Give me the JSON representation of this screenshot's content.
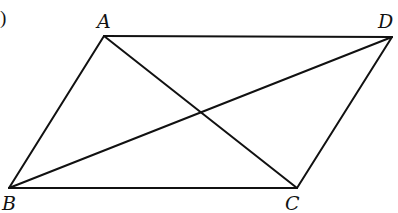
{
  "figure": {
    "type": "parallelogram-with-diagonals",
    "fragment_text": ")",
    "vertices": {
      "A": {
        "label": "A",
        "x": 104,
        "y": 36,
        "lx": 97,
        "ly": 28
      },
      "D": {
        "label": "D",
        "x": 392,
        "y": 37,
        "lx": 378,
        "ly": 28
      },
      "B": {
        "label": "B",
        "x": 9,
        "y": 188,
        "lx": 2,
        "ly": 210
      },
      "C": {
        "label": "C",
        "x": 297,
        "y": 188,
        "lx": 285,
        "ly": 210
      }
    },
    "sides": [
      "AD",
      "DC",
      "CB",
      "BA"
    ],
    "diagonals": [
      "AC",
      "BD"
    ],
    "line_color": "#111111"
  }
}
